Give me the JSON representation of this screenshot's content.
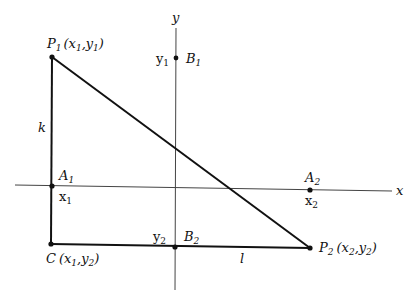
{
  "diagram": {
    "type": "coordinate-geometry",
    "axes": {
      "x_label": "x",
      "y_label": "y"
    },
    "points": {
      "P1": {
        "name": "P",
        "sub": "1",
        "coords_text": "(x",
        "c1": "1",
        "sep": ",y",
        "c2": "1",
        "close": ")"
      },
      "P2": {
        "name": "P",
        "sub": "2",
        "coords_text": "(x",
        "c1": "2",
        "sep": ",y",
        "c2": "2",
        "close": ")"
      },
      "C": {
        "name": "C",
        "coords_text": "(x",
        "c1": "1",
        "sep": ",y",
        "c2": "2",
        "close": ")"
      },
      "A1": {
        "name": "A",
        "sub": "1",
        "tick": "x",
        "tick_sub": "1"
      },
      "A2": {
        "name": "A",
        "sub": "2",
        "tick": "x",
        "tick_sub": "2"
      },
      "B1": {
        "name": "B",
        "sub": "1",
        "tick": "y",
        "tick_sub": "1"
      },
      "B2": {
        "name": "B",
        "sub": "2",
        "tick": "y",
        "tick_sub": "2"
      }
    },
    "segments": {
      "k": "k",
      "l": "l"
    }
  }
}
